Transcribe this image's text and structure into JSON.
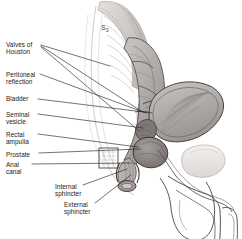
{
  "figure": {
    "background_color": "#ffffff",
    "ink_color": "#1a1a1a",
    "tissue_fill": "#b9b4b0",
    "tissue_fill_light": "#d8d4d1",
    "tissue_fill_dark": "#8f8a87"
  },
  "vertebra_marker": {
    "name": "S",
    "subscript": "3",
    "full": "S3"
  },
  "labels": [
    {
      "id": "valves-of-houston",
      "text": "Valves of\nHouston",
      "x": 6,
      "y": 41,
      "align": "left"
    },
    {
      "id": "peritoneal-reflection",
      "text": "Peritoneal\nreflection",
      "x": 6,
      "y": 71,
      "align": "left"
    },
    {
      "id": "bladder",
      "text": "Bladder",
      "x": 6,
      "y": 95,
      "align": "left"
    },
    {
      "id": "seminal-vesicle",
      "text": "Seminal\nvesicle",
      "x": 6,
      "y": 111,
      "align": "left"
    },
    {
      "id": "rectal-ampulla",
      "text": "Rectal\nampulla",
      "x": 6,
      "y": 131,
      "align": "left"
    },
    {
      "id": "prostate",
      "text": "Prostate",
      "x": 6,
      "y": 151,
      "align": "left"
    },
    {
      "id": "anal-canal",
      "text": "Anal\ncanal",
      "x": 6,
      "y": 161,
      "align": "left"
    },
    {
      "id": "internal-sphincter",
      "text": "Internal\nsphincter",
      "x": 55,
      "y": 183,
      "align": "left"
    },
    {
      "id": "external-sphincter",
      "text": "External\nsphincter",
      "x": 64,
      "y": 201,
      "align": "left"
    }
  ],
  "leader_lines": [
    {
      "id": "leader-valves-of-houston-1",
      "x1": 41,
      "y1": 45,
      "x2": 110,
      "y2": 66
    },
    {
      "id": "leader-valves-of-houston-2",
      "x1": 41,
      "y1": 46,
      "x2": 141,
      "y2": 111
    },
    {
      "id": "leader-valves-of-houston-3",
      "x1": 41,
      "y1": 47,
      "x2": 139,
      "y2": 131
    },
    {
      "id": "leader-peritoneal-reflection",
      "x1": 40,
      "y1": 74,
      "x2": 146,
      "y2": 113
    },
    {
      "id": "leader-bladder",
      "x1": 38,
      "y1": 99,
      "x2": 152,
      "y2": 113
    },
    {
      "id": "leader-seminal-vesicle",
      "x1": 38,
      "y1": 114,
      "x2": 143,
      "y2": 128
    },
    {
      "id": "leader-rectal-ampulla",
      "x1": 38,
      "y1": 134,
      "x2": 138,
      "y2": 147
    },
    {
      "id": "leader-prostate",
      "x1": 39,
      "y1": 153,
      "x2": 140,
      "y2": 149
    },
    {
      "id": "leader-anal-canal",
      "x1": 32,
      "y1": 164,
      "x2": 131,
      "y2": 163
    },
    {
      "id": "leader-internal-sphincter",
      "x1": 83,
      "y1": 185,
      "x2": 127,
      "y2": 169
    },
    {
      "id": "leader-external-sphincter",
      "x1": 95,
      "y1": 203,
      "x2": 131,
      "y2": 175
    }
  ],
  "anatomy_parts": [
    "sacrum",
    "rectum",
    "rectal-ampulla",
    "bladder",
    "seminal-vesicle",
    "prostate",
    "anal-canal",
    "internal-sphincter",
    "external-sphincter",
    "penis",
    "scrotum",
    "peritoneal-reflection",
    "pubic-symphysis"
  ],
  "inset_box": {
    "x": 99,
    "y": 148,
    "width": 19,
    "height": 20
  }
}
